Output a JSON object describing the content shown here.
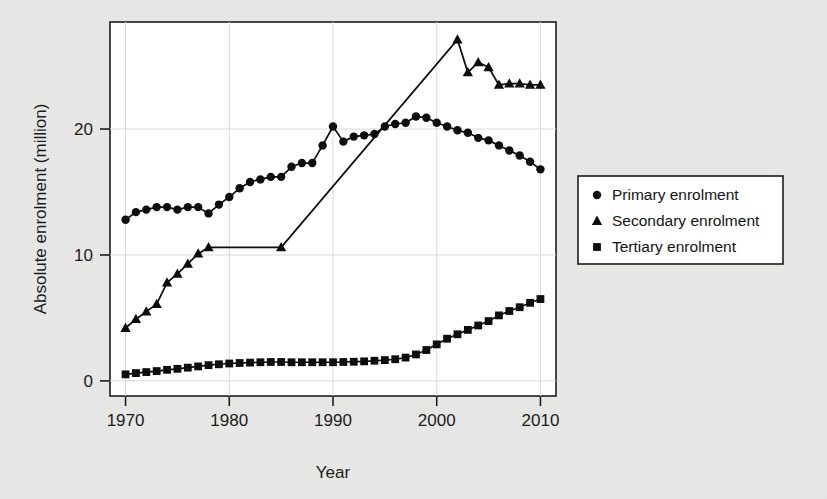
{
  "chart_data": {
    "type": "line",
    "title": "",
    "xlabel": "Year",
    "ylabel": "Absolute enrolment (million)",
    "xlim": [
      1968.5,
      2011.5
    ],
    "ylim": [
      -1.2,
      28.5
    ],
    "xticks": [
      1970,
      1980,
      1990,
      2000,
      2010
    ],
    "yticks": [
      0,
      10,
      20
    ],
    "xtick_labels": [
      "1970",
      "1980",
      "1990",
      "2000",
      "2010"
    ],
    "ytick_labels": [
      "0",
      "10",
      "20"
    ],
    "grid": true,
    "legend_position": "right-outside",
    "series": [
      {
        "name": "Primary enrolment",
        "marker": "circle",
        "x": [
          1970,
          1971,
          1972,
          1973,
          1974,
          1975,
          1976,
          1977,
          1978,
          1979,
          1980,
          1981,
          1982,
          1983,
          1984,
          1985,
          1986,
          1987,
          1988,
          1989,
          1990,
          1991,
          1992,
          1993,
          1994,
          1995,
          1996,
          1997,
          1998,
          1999,
          2000,
          2001,
          2002,
          2003,
          2004,
          2005,
          2006,
          2007,
          2008,
          2009,
          2010
        ],
        "values": [
          12.8,
          13.4,
          13.6,
          13.8,
          13.8,
          13.6,
          13.8,
          13.8,
          13.3,
          14.0,
          14.6,
          15.3,
          15.8,
          16.0,
          16.2,
          16.2,
          17.0,
          17.3,
          17.3,
          18.7,
          20.2,
          19.0,
          19.4,
          19.5,
          19.6,
          20.2,
          20.4,
          20.5,
          21.0,
          20.9,
          20.5,
          20.2,
          19.9,
          19.7,
          19.3,
          19.1,
          18.7,
          18.3,
          17.9,
          17.4,
          16.8
        ]
      },
      {
        "name": "Secondary enrolment",
        "marker": "triangle",
        "x": [
          1970,
          1971,
          1972,
          1973,
          1974,
          1975,
          1976,
          1977,
          1978,
          1985,
          2002,
          2003,
          2004,
          2005,
          2006,
          2007,
          2008,
          2009,
          2010
        ],
        "values": [
          4.2,
          4.9,
          5.5,
          6.1,
          7.8,
          8.5,
          9.3,
          10.1,
          10.6,
          10.6,
          27.1,
          24.5,
          25.3,
          24.9,
          23.5,
          23.6,
          23.6,
          23.5,
          23.5
        ]
      },
      {
        "name": "Tertiary enrolment",
        "marker": "square",
        "x": [
          1970,
          1971,
          1972,
          1973,
          1974,
          1975,
          1976,
          1977,
          1978,
          1979,
          1980,
          1981,
          1982,
          1983,
          1984,
          1985,
          1986,
          1987,
          1988,
          1989,
          1990,
          1991,
          1992,
          1993,
          1994,
          1995,
          1996,
          1997,
          1998,
          1999,
          2000,
          2001,
          2002,
          2003,
          2004,
          2005,
          2006,
          2007,
          2008,
          2009,
          2010
        ],
        "values": [
          0.52,
          0.62,
          0.7,
          0.78,
          0.88,
          0.96,
          1.05,
          1.15,
          1.25,
          1.32,
          1.38,
          1.42,
          1.45,
          1.48,
          1.5,
          1.5,
          1.48,
          1.48,
          1.48,
          1.48,
          1.48,
          1.5,
          1.52,
          1.55,
          1.6,
          1.65,
          1.72,
          1.85,
          2.1,
          2.45,
          2.9,
          3.35,
          3.7,
          4.05,
          4.4,
          4.75,
          5.2,
          5.55,
          5.85,
          6.2,
          6.5
        ]
      }
    ]
  },
  "axes": {
    "ylabel": "Absolute enrolment (million)",
    "xlabel": "Year"
  },
  "legend": {
    "items": [
      {
        "label": "Primary enrolment",
        "marker": "circle-marker"
      },
      {
        "label": "Secondary enrolment",
        "marker": "triangle-marker"
      },
      {
        "label": "Tertiary enrolment",
        "marker": "square-marker"
      }
    ]
  }
}
